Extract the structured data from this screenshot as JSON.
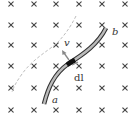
{
  "diagram": {
    "field": {
      "symbol": "×",
      "direction": "into-page",
      "columns_x": [
        11,
        34,
        56,
        79,
        102,
        125
      ],
      "rows_y": [
        4,
        25,
        45,
        66,
        88,
        110
      ],
      "color": "#444444"
    },
    "wire": {
      "start_label": "a",
      "end_label": "b",
      "fill_color": "#bbbbbb",
      "outline_color": "#333333"
    },
    "velocity": {
      "label": "v"
    },
    "element": {
      "label": "dl"
    },
    "trajectory": {
      "style": "dashed",
      "color": "#bbbbbb"
    }
  }
}
